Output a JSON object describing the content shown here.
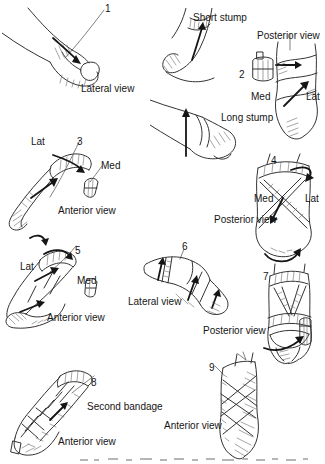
{
  "colors": {
    "ink": "#333333",
    "bold_arrow": "#151515",
    "background": "#ffffff"
  },
  "fig1": {
    "number": "1",
    "caption": "Lateral view"
  },
  "fig2": {
    "number": "2",
    "short_stump_label": "Short stump",
    "long_stump_label": "Long stump",
    "view_label": "Posterior view",
    "med_label": "Med",
    "lat_label": "Lat"
  },
  "fig3": {
    "number": "3",
    "lat_label": "Lat",
    "med_label": "Med",
    "caption": "Anterior view"
  },
  "fig4": {
    "number": "4",
    "med_label": "Med",
    "lat_label": "Lat",
    "caption": "Posterior view"
  },
  "fig5": {
    "number": "5",
    "lat_label": "Lat",
    "med_label": "Med",
    "caption": "Anterior view"
  },
  "fig6": {
    "number": "6",
    "caption": "Lateral view"
  },
  "fig7": {
    "number": "7",
    "caption": "Posterior view"
  },
  "fig8": {
    "number": "8",
    "note_label": "Second bandage",
    "caption": "Anterior view"
  },
  "fig9": {
    "number": "9",
    "caption": "Anterior view"
  }
}
